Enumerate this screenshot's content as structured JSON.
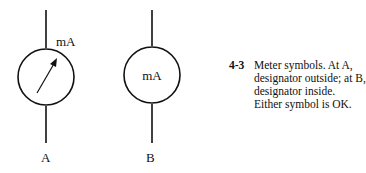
{
  "symbol_a": {
    "designator": "mA",
    "label": "A"
  },
  "symbol_b": {
    "designator": "mA",
    "label": "B"
  },
  "caption": {
    "figure_number": "4-3",
    "text": "Meter symbols. At A, designator outside; at B, designator inside. Either symbol is OK."
  }
}
